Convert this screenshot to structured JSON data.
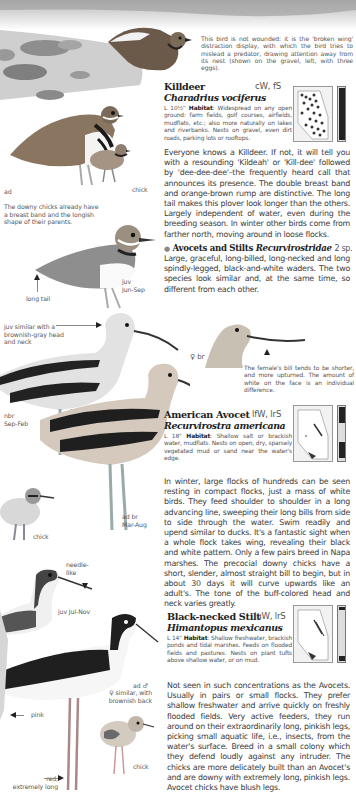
{
  "header_scene": {
    "caption": "This bird is not wounded: it is the 'broken wing' distraction display, with which the bird tries to mislead a predator, drawing attention away from its nest (shown on the gravel, left, with three eggs)."
  },
  "killdeer": {
    "name": "Killdeer",
    "status_code": "cW, fS",
    "latin": "Charadrius vociferus",
    "length": "L 10½\"",
    "habitat_label": "Habitat",
    "habitat_text": ": Widespread on any open ground: farm fields, golf courses, airfields, mudflats, etc.; also more naturally on lakes and riverbanks. Nests on gravel, even dirt roads, parking lots or rooftops.",
    "description": "Everyone knows a Killdeer. If not, it will tell you with a resounding 'Kildeah' or 'Kill-dee' followed by 'dee-dee-dee'–the frequently heard call that announces its presence. The double breast band and orange-brown rump are distinctive. The long tail makes this plover look longer than the others. Largely independent of water, even during the breeding season. In winter other birds come from farther north, moving around in loose flocks.",
    "labels": {
      "ad": "ad",
      "chick": "chick",
      "chick_caption": "The downy chicks already have a breast band and the longish shape of their parents.",
      "long_tail": "long tail",
      "juv": "juv\nJun-Sep"
    }
  },
  "family": {
    "bullet": "●",
    "name": "Avocets and Stilts",
    "latin": "Recurvirostridae",
    "count": "2 sp.",
    "description": "Large, graceful, long-billed, long-necked and long spindly-legged, black-and-white waders. The two species look similar and, at the same time, so different from each other."
  },
  "avocet": {
    "name": "American Avocet",
    "status_code": "lfW, lrS",
    "latin": "Recurvirostra americana",
    "length": "L 18\"",
    "habitat_label": "Habitat",
    "habitat_text": ": Shallow salt or brackish water, mudflats. Nests on open, dry, sparsely vegetated mud or sand near the water's edge.",
    "description": "In winter, large flocks of hundreds can be seen resting in compact flocks, just a mass of white birds. They feed shoulder to shoulder in a long advancing line, sweeping their long bills from side to side through the water. Swim readily and upend similar to ducks. It's a fantastic sight when a whole flock takes wing, revealing their black and white pattern. Only a few pairs breed in Napa marshes. The precocial downy chicks have a short, slender, almost straight bill to begin, but in about 30 days it will curve upwards like an adult's. The tone of the buff-colored head and neck varies greatly.",
    "labels": {
      "juv_note": "juv similar with a brownish-gray head and neck",
      "female_br": "♀ br",
      "female_note": "The female's bill tends to be shorter, and more upturned. The amount of white on the face is an individual difference.",
      "nbr": "nbr\nSep-Feb",
      "ad_br": "ad br\nMar-Aug",
      "chick": "chick"
    }
  },
  "stilt": {
    "name": "Black-necked Stilt",
    "status_code": "luW, lrS",
    "latin": "Himantopus mexicanus",
    "length": "L 14\"",
    "habitat_label": "Habitat",
    "habitat_text": ": Shallow freshwater, brackish ponds and tidal marshes. Feeds on flooded fields and pastures. Nests on plant tufts above shallow water, or on mud.",
    "description": "Not seen in such concentrations as the Avocets. Usually in pairs or small flocks. They prefer shallow freshwater and arrive quickly on freshly flooded fields. Very active feeders, they run around on their extraordinarily long, pinkish legs, picking small aquatic life, i.e., insects, from the water's surface. Breed in a small colony which they defend loudly against any intruder. The chicks are more delicately built than an Avocet's and are downy with extremely long, pinkish legs. Avocet chicks have blush legs.",
    "labels": {
      "needle": "needle-\nlike",
      "juv": "juv Jul-Nov",
      "ad_male": "ad ♂",
      "female_note": "♀ similar, with brownish back",
      "pink": "pink",
      "chick": "chick",
      "red": "red,\nextremely long"
    }
  },
  "colors": {
    "background": "#ffffff",
    "text": "#3c3c3c",
    "heading": "#222222",
    "map_fill": "#f2f2f2",
    "bird_dark": "#1f1f1f",
    "bird_gray": "#8a8a8a"
  }
}
